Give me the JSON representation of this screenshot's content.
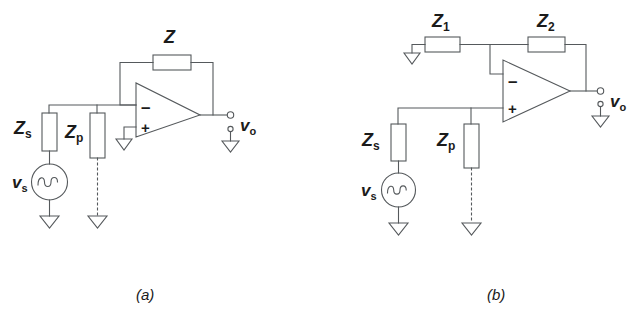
{
  "figure": {
    "type": "circuit-schematic",
    "line_color": "#55595c",
    "text_color": "#1b1b1b",
    "background": "#ffffff"
  },
  "panels": [
    {
      "id": "a",
      "caption": "(a)",
      "topology": "inverting amplifier with feedback impedance Z, non-inverting input grounded",
      "components": [
        {
          "name": "Z",
          "kind": "impedance-box",
          "label": "Z",
          "subscript": "",
          "role": "feedback-impedance"
        },
        {
          "name": "Zs",
          "kind": "impedance-box",
          "label": "Z",
          "subscript": "s",
          "role": "source-impedance"
        },
        {
          "name": "Zp",
          "kind": "impedance-box",
          "label": "Z",
          "subscript": "p",
          "role": "parallel-impedance"
        },
        {
          "name": "vs",
          "kind": "ac-source",
          "label": "v",
          "subscript": "s",
          "role": "signal-source"
        },
        {
          "name": "vo",
          "kind": "output-terminal",
          "label": "v",
          "subscript": "o",
          "role": "output-voltage"
        }
      ],
      "opamp": {
        "inverting_sign": "–",
        "noninverting_sign": "+",
        "noninverting_input": "grounded"
      },
      "grounds": 4
    },
    {
      "id": "b",
      "caption": "(b)",
      "topology": "non-inverting amplifier with feedback divider Z1/Z2, signal applied to + input",
      "components": [
        {
          "name": "Z1",
          "kind": "impedance-box",
          "label": "Z",
          "subscript": "1",
          "role": "feedback-shunt-impedance"
        },
        {
          "name": "Z2",
          "kind": "impedance-box",
          "label": "Z",
          "subscript": "2",
          "role": "feedback-series-impedance"
        },
        {
          "name": "Zs",
          "kind": "impedance-box",
          "label": "Z",
          "subscript": "s",
          "role": "source-impedance"
        },
        {
          "name": "Zp",
          "kind": "impedance-box",
          "label": "Z",
          "subscript": "p",
          "role": "parallel-impedance"
        },
        {
          "name": "vs",
          "kind": "ac-source",
          "label": "v",
          "subscript": "s",
          "role": "signal-source"
        },
        {
          "name": "vo",
          "kind": "output-terminal",
          "label": "v",
          "subscript": "o",
          "role": "output-voltage"
        }
      ],
      "opamp": {
        "inverting_sign": "–",
        "noninverting_sign": "+",
        "inverting_input": "feedback-divider"
      },
      "grounds": 4
    }
  ],
  "labels": {
    "a": {
      "z_main": "Z",
      "z_main_sub": "",
      "zs": "Z",
      "zs_sub": "s",
      "zp": "Z",
      "zp_sub": "p",
      "vs": "v",
      "vs_sub": "s",
      "vo": "v",
      "vo_sub": "o",
      "minus": "–",
      "plus": "+",
      "caption": "(a)"
    },
    "b": {
      "z1": "Z",
      "z1_sub": "1",
      "z2": "Z",
      "z2_sub": "2",
      "zs": "Z",
      "zs_sub": "s",
      "zp": "Z",
      "zp_sub": "p",
      "vs": "v",
      "vs_sub": "s",
      "vo": "v",
      "vo_sub": "o",
      "minus": "–",
      "plus": "+",
      "caption": "(b)"
    }
  }
}
